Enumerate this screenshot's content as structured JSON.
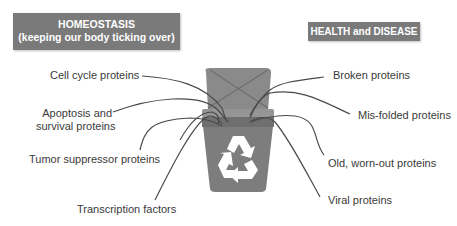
{
  "headers": {
    "left_line1": "HOMEOSTASIS",
    "left_line2": "(keeping our body ticking over)",
    "right": "HEALTH and DISEASE"
  },
  "left_labels": [
    {
      "text": "Cell cycle proteins"
    },
    {
      "text_line1": "Apoptosis and",
      "text_line2": "survival proteins"
    },
    {
      "text": "Tumor suppressor proteins"
    },
    {
      "text": "Transcription factors"
    }
  ],
  "right_labels": [
    {
      "text": "Broken proteins"
    },
    {
      "text": "Mis-folded proteins"
    },
    {
      "text": "Old, worn-out proteins"
    },
    {
      "text": "Viral proteins"
    }
  ],
  "bin": {
    "icon": "recycle-icon",
    "body_color": "#7d7d7d",
    "lid_color": "#8a8a8a",
    "symbol_color": "#ffffff"
  },
  "colors": {
    "header_bg": "#7a7a7a",
    "line": "#4a4a4a",
    "text": "#3a3a3a"
  }
}
